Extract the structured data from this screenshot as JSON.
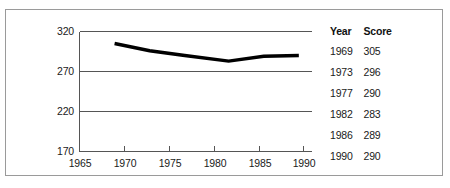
{
  "chart_data": {
    "type": "line",
    "title": "",
    "xlabel": "",
    "ylabel": "",
    "x": [
      1969,
      1973,
      1977,
      1982,
      1986,
      1990
    ],
    "values": [
      305,
      296,
      290,
      283,
      289,
      290
    ],
    "series": [
      {
        "name": "Score",
        "x": [
          1969,
          1973,
          1977,
          1982,
          1986,
          1990
        ],
        "values": [
          305,
          296,
          290,
          283,
          289,
          290
        ]
      }
    ],
    "xlim": [
      1965,
      1991.5
    ],
    "ylim": [
      170,
      320
    ],
    "yticks": [
      170,
      220,
      270,
      320
    ],
    "ytick_labels": [
      "170",
      "220",
      "270",
      "320"
    ],
    "xticks": [
      1965,
      1970,
      1975,
      1980,
      1985,
      1990
    ],
    "xtick_labels": [
      "1965",
      "1970",
      "1975",
      "1980",
      "1985",
      "1990"
    ],
    "grid": true,
    "grid_axis": "y",
    "legend": false,
    "line_color": "#000000",
    "grid_color": "#555555",
    "axis_color": "#555555",
    "frame_color": "#9a9a9a"
  },
  "table": {
    "headers": {
      "year": "Year",
      "score": "Score"
    },
    "rows": [
      {
        "year": "1969",
        "score": "305"
      },
      {
        "year": "1973",
        "score": "296"
      },
      {
        "year": "1977",
        "score": "290"
      },
      {
        "year": "1982",
        "score": "283"
      },
      {
        "year": "1986",
        "score": "289"
      },
      {
        "year": "1990",
        "score": "290"
      }
    ]
  }
}
